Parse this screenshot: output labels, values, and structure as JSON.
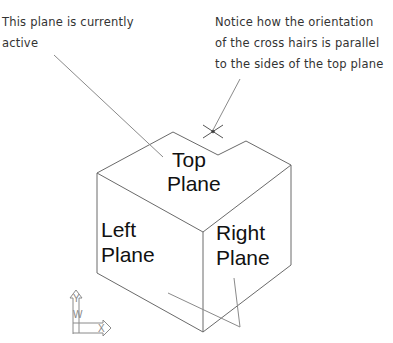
{
  "callouts": {
    "active_plane": {
      "lines": [
        "This plane is currently",
        "active"
      ]
    },
    "crosshairs": {
      "lines": [
        "Notice how the orientation",
        "of the cross hairs is parallel",
        "to the sides of the top plane"
      ]
    }
  },
  "planes": {
    "top": [
      "Top",
      "Plane"
    ],
    "left": [
      "Left",
      "Plane"
    ],
    "right": [
      "Right",
      "Plane"
    ]
  },
  "ucs_icon": {
    "y_label": "Y",
    "w_label": "W",
    "x_label": "X"
  },
  "colors": {
    "edge": "#555555",
    "leader": "#888888",
    "text": "#333333",
    "label": "#111111"
  }
}
